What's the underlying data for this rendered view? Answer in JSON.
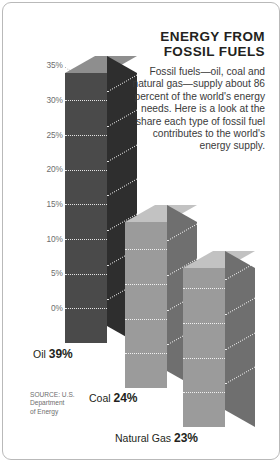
{
  "headline": {
    "title_line1": "ENERGY FROM",
    "title_line2": "FOSSIL FUELS",
    "body": "Fossil fuels—oil, coal and natural gas—supply about 86 percent of the world's energy needs. Here is a look at the share each type of fossil fuel contributes to the world's energy supply."
  },
  "source": {
    "line1": "SOURCE: U.S.",
    "line2": "Department",
    "line3": "of Energy"
  },
  "captions": [
    {
      "name": "Oil",
      "value": "39%"
    },
    {
      "name": "Coal",
      "value": "24%"
    },
    {
      "name": "Natural Gas",
      "value": "23%"
    }
  ],
  "colors": {
    "oil_front": "#4a4a4a",
    "oil_side": "#2e2e2e",
    "oil_top": "#8e8e8e",
    "light_front": "#9b9b9b",
    "light_side": "#6f6f6f",
    "light_top": "#c2c2c2",
    "text": "#231f20",
    "muted": "#6d6d6d",
    "border": "#b9b9b9"
  },
  "chart_data": {
    "type": "bar",
    "title": "ENERGY FROM FOSSIL FUELS",
    "categories": [
      "Oil",
      "Coal",
      "Natural Gas"
    ],
    "values": [
      39,
      24,
      23
    ],
    "value_labels": [
      "39%",
      "24%",
      "23%"
    ],
    "xlabel": "",
    "ylabel": "",
    "ylim": [
      0,
      35
    ],
    "ytick_values": [
      0,
      5,
      10,
      15,
      20,
      25,
      30,
      35
    ],
    "ytick_labels": [
      "0%",
      "5%",
      "10%",
      "15%",
      "20%",
      "25%",
      "30%",
      "35%"
    ],
    "grid": true,
    "legend": "none",
    "projection": "isometric-3d",
    "note": "Bars exceed the 35% axis maximum; Oil at 39% rises above the top tick."
  }
}
